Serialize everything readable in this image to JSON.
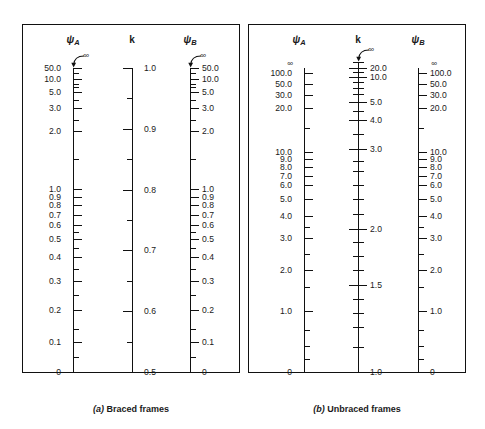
{
  "figure": {
    "panels": [
      {
        "id": "braced",
        "caption_letter": "(a)",
        "caption_text": "Braced frames",
        "headers": {
          "psi_a": "ψ",
          "psi_a_sub": "A",
          "k": "k",
          "psi_b": "ψ",
          "psi_b_sub": "B"
        },
        "infinity_symbol": "∞"
      },
      {
        "id": "unbraced",
        "caption_letter": "(b)",
        "caption_text": "Unbraced frames",
        "headers": {
          "psi_a": "ψ",
          "psi_a_sub": "A",
          "k": "k",
          "psi_b": "ψ",
          "psi_b_sub": "B"
        },
        "infinity_symbol": "∞"
      }
    ]
  },
  "chart_data": [
    {
      "type": "line",
      "title": "(a) Braced frames",
      "subtitle": "Alignment chart (nomograph) for effective length factor K",
      "grid": false,
      "legend": "none",
      "xlabel": "",
      "ylabel": "",
      "scales": [
        {
          "name": "psi_A",
          "label": "ψA",
          "position": "left",
          "tick_side": "right",
          "label_side": "left",
          "top_value": "∞",
          "has_infinity_arrow": true,
          "bottom_value": "0",
          "ticks": [
            {
              "label": "50.0",
              "major": true,
              "y": 0.0
            },
            {
              "label": "",
              "major": false,
              "y": 0.018
            },
            {
              "label": "10.0",
              "major": true,
              "y": 0.036
            },
            {
              "label": "",
              "major": false,
              "y": 0.052
            },
            {
              "label": "",
              "major": false,
              "y": 0.064
            },
            {
              "label": "5.0",
              "major": true,
              "y": 0.078
            },
            {
              "label": "",
              "major": false,
              "y": 0.104
            },
            {
              "label": "3.0",
              "major": true,
              "y": 0.13
            },
            {
              "label": "",
              "major": false,
              "y": 0.17
            },
            {
              "label": "2.0",
              "major": true,
              "y": 0.208
            },
            {
              "label": "",
              "major": false,
              "y": 0.3
            },
            {
              "label": "1.0",
              "major": true,
              "y": 0.398
            },
            {
              "label": "0.9",
              "major": true,
              "y": 0.424
            },
            {
              "label": "0.8",
              "major": true,
              "y": 0.452
            },
            {
              "label": "0.7",
              "major": true,
              "y": 0.483
            },
            {
              "label": "0.6",
              "major": true,
              "y": 0.518
            },
            {
              "label": "",
              "major": false,
              "y": 0.54
            },
            {
              "label": "0.5",
              "major": true,
              "y": 0.562
            },
            {
              "label": "",
              "major": false,
              "y": 0.592
            },
            {
              "label": "0.4",
              "major": true,
              "y": 0.622
            },
            {
              "label": "",
              "major": false,
              "y": 0.66
            },
            {
              "label": "0.3",
              "major": true,
              "y": 0.7
            },
            {
              "label": "",
              "major": false,
              "y": 0.748
            },
            {
              "label": "0.2",
              "major": true,
              "y": 0.796
            },
            {
              "label": "",
              "major": false,
              "y": 0.858
            },
            {
              "label": "0.1",
              "major": true,
              "y": 0.9
            },
            {
              "label": "",
              "major": false,
              "y": 0.952
            },
            {
              "label": "0",
              "major": true,
              "y": 1.0
            }
          ]
        },
        {
          "name": "k",
          "label": "k",
          "position": "center",
          "tick_side": "left",
          "label_side": "right",
          "top_value": "1.0",
          "has_infinity_arrow": false,
          "bottom_value": "0.5",
          "ticks": [
            {
              "label": "1.0",
              "major": true,
              "y": 0.0
            },
            {
              "label": "",
              "major": false,
              "y": 0.1
            },
            {
              "label": "0.9",
              "major": true,
              "y": 0.2
            },
            {
              "label": "",
              "major": false,
              "y": 0.3
            },
            {
              "label": "0.8",
              "major": true,
              "y": 0.4
            },
            {
              "label": "",
              "major": false,
              "y": 0.5
            },
            {
              "label": "0.7",
              "major": true,
              "y": 0.6
            },
            {
              "label": "",
              "major": false,
              "y": 0.7
            },
            {
              "label": "0.6",
              "major": true,
              "y": 0.8
            },
            {
              "label": "",
              "major": false,
              "y": 0.9
            },
            {
              "label": "0.5",
              "major": true,
              "y": 1.0
            }
          ]
        },
        {
          "name": "psi_B",
          "label": "ψB",
          "position": "right",
          "tick_side": "right",
          "label_side": "right",
          "top_value": "∞",
          "has_infinity_arrow": true,
          "bottom_value": "0",
          "ticks": [
            {
              "label": "50.0",
              "major": true,
              "y": 0.0
            },
            {
              "label": "",
              "major": false,
              "y": 0.018
            },
            {
              "label": "10.0",
              "major": true,
              "y": 0.036
            },
            {
              "label": "",
              "major": false,
              "y": 0.052
            },
            {
              "label": "",
              "major": false,
              "y": 0.064
            },
            {
              "label": "5.0",
              "major": true,
              "y": 0.078
            },
            {
              "label": "",
              "major": false,
              "y": 0.104
            },
            {
              "label": "3.0",
              "major": true,
              "y": 0.13
            },
            {
              "label": "",
              "major": false,
              "y": 0.17
            },
            {
              "label": "2.0",
              "major": true,
              "y": 0.208
            },
            {
              "label": "",
              "major": false,
              "y": 0.3
            },
            {
              "label": "1.0",
              "major": true,
              "y": 0.398
            },
            {
              "label": "0.9",
              "major": true,
              "y": 0.424
            },
            {
              "label": "0.8",
              "major": true,
              "y": 0.452
            },
            {
              "label": "0.7",
              "major": true,
              "y": 0.483
            },
            {
              "label": "0.6",
              "major": true,
              "y": 0.518
            },
            {
              "label": "",
              "major": false,
              "y": 0.54
            },
            {
              "label": "0.5",
              "major": true,
              "y": 0.562
            },
            {
              "label": "",
              "major": false,
              "y": 0.592
            },
            {
              "label": "0.4",
              "major": true,
              "y": 0.622
            },
            {
              "label": "",
              "major": false,
              "y": 0.66
            },
            {
              "label": "0.3",
              "major": true,
              "y": 0.7
            },
            {
              "label": "",
              "major": false,
              "y": 0.748
            },
            {
              "label": "0.2",
              "major": true,
              "y": 0.796
            },
            {
              "label": "",
              "major": false,
              "y": 0.858
            },
            {
              "label": "0.1",
              "major": true,
              "y": 0.9
            },
            {
              "label": "",
              "major": false,
              "y": 0.952
            },
            {
              "label": "0",
              "major": true,
              "y": 1.0
            }
          ]
        }
      ]
    },
    {
      "type": "line",
      "title": "(b) Unbraced frames",
      "subtitle": "Alignment chart (nomograph) for effective length factor K",
      "grid": false,
      "legend": "none",
      "xlabel": "",
      "ylabel": "",
      "scales": [
        {
          "name": "psi_A",
          "label": "ψA",
          "position": "left",
          "tick_side": "right",
          "label_side": "left",
          "top_value": "∞",
          "has_infinity_arrow": false,
          "bottom_value": "0",
          "ticks": [
            {
              "label": "100.0",
              "major": true,
              "y": 0.018
            },
            {
              "label": "50.0",
              "major": true,
              "y": 0.052
            },
            {
              "label": "30.0",
              "major": true,
              "y": 0.09
            },
            {
              "label": "20.0",
              "major": true,
              "y": 0.132
            },
            {
              "label": "",
              "major": false,
              "y": 0.196
            },
            {
              "label": "10.0",
              "major": true,
              "y": 0.276
            },
            {
              "label": "9.0",
              "major": true,
              "y": 0.3
            },
            {
              "label": "8.0",
              "major": true,
              "y": 0.326
            },
            {
              "label": "7.0",
              "major": true,
              "y": 0.354
            },
            {
              "label": "6.0",
              "major": true,
              "y": 0.386
            },
            {
              "label": "5.0",
              "major": true,
              "y": 0.43
            },
            {
              "label": "4.0",
              "major": true,
              "y": 0.486
            },
            {
              "label": "",
              "major": false,
              "y": 0.524
            },
            {
              "label": "3.0",
              "major": true,
              "y": 0.56
            },
            {
              "label": "",
              "major": false,
              "y": 0.612
            },
            {
              "label": "2.0",
              "major": true,
              "y": 0.666
            },
            {
              "label": "",
              "major": false,
              "y": 0.72
            },
            {
              "label": "1.0",
              "major": true,
              "y": 0.8
            },
            {
              "label": "",
              "major": false,
              "y": 0.862
            },
            {
              "label": "",
              "major": false,
              "y": 0.916
            },
            {
              "label": "",
              "major": false,
              "y": 0.958
            },
            {
              "label": "0",
              "major": true,
              "y": 1.0
            }
          ]
        },
        {
          "name": "k",
          "label": "k",
          "position": "center",
          "tick_side": "both",
          "label_side": "right",
          "top_value": "∞",
          "has_infinity_arrow": true,
          "bottom_value": "1.0",
          "ticks": [
            {
              "label": "",
              "major": false,
              "y": 0.0
            },
            {
              "label": "20.0",
              "major": true,
              "y": 0.018
            },
            {
              "label": "",
              "major": false,
              "y": 0.032
            },
            {
              "label": "10.0",
              "major": true,
              "y": 0.048
            },
            {
              "label": "",
              "major": false,
              "y": 0.066
            },
            {
              "label": "",
              "major": false,
              "y": 0.084
            },
            {
              "label": "",
              "major": false,
              "y": 0.104
            },
            {
              "label": "5.0",
              "major": true,
              "y": 0.13
            },
            {
              "label": "",
              "major": false,
              "y": 0.158
            },
            {
              "label": "4.0",
              "major": true,
              "y": 0.188
            },
            {
              "label": "",
              "major": false,
              "y": 0.232
            },
            {
              "label": "3.0",
              "major": true,
              "y": 0.282
            },
            {
              "label": "",
              "major": false,
              "y": 0.318
            },
            {
              "label": "",
              "major": false,
              "y": 0.352
            },
            {
              "label": "",
              "major": false,
              "y": 0.396
            },
            {
              "label": "",
              "major": false,
              "y": 0.442
            },
            {
              "label": "",
              "major": false,
              "y": 0.49
            },
            {
              "label": "2.0",
              "major": true,
              "y": 0.54
            },
            {
              "label": "",
              "major": false,
              "y": 0.58
            },
            {
              "label": "",
              "major": false,
              "y": 0.626
            },
            {
              "label": "",
              "major": false,
              "y": 0.672
            },
            {
              "label": "1.5",
              "major": true,
              "y": 0.718
            },
            {
              "label": "",
              "major": false,
              "y": 0.764
            },
            {
              "label": "",
              "major": false,
              "y": 0.81
            },
            {
              "label": "",
              "major": false,
              "y": 0.856
            },
            {
              "label": "",
              "major": false,
              "y": 0.92
            },
            {
              "label": "1.0",
              "major": true,
              "y": 1.0
            }
          ]
        },
        {
          "name": "psi_B",
          "label": "ψB",
          "position": "right",
          "tick_side": "right",
          "label_side": "right",
          "top_value": "∞",
          "has_infinity_arrow": false,
          "bottom_value": "0",
          "ticks": [
            {
              "label": "100.0",
              "major": true,
              "y": 0.018
            },
            {
              "label": "50.0",
              "major": true,
              "y": 0.052
            },
            {
              "label": "30.0",
              "major": true,
              "y": 0.09
            },
            {
              "label": "20.0",
              "major": true,
              "y": 0.132
            },
            {
              "label": "",
              "major": false,
              "y": 0.196
            },
            {
              "label": "10.0",
              "major": true,
              "y": 0.276
            },
            {
              "label": "9.0",
              "major": true,
              "y": 0.3
            },
            {
              "label": "8.0",
              "major": true,
              "y": 0.326
            },
            {
              "label": "7.0",
              "major": true,
              "y": 0.354
            },
            {
              "label": "6.0",
              "major": true,
              "y": 0.386
            },
            {
              "label": "5.0",
              "major": true,
              "y": 0.43
            },
            {
              "label": "4.0",
              "major": true,
              "y": 0.486
            },
            {
              "label": "",
              "major": false,
              "y": 0.524
            },
            {
              "label": "3.0",
              "major": true,
              "y": 0.56
            },
            {
              "label": "",
              "major": false,
              "y": 0.612
            },
            {
              "label": "2.0",
              "major": true,
              "y": 0.666
            },
            {
              "label": "",
              "major": false,
              "y": 0.72
            },
            {
              "label": "1.0",
              "major": true,
              "y": 0.8
            },
            {
              "label": "",
              "major": false,
              "y": 0.862
            },
            {
              "label": "",
              "major": false,
              "y": 0.916
            },
            {
              "label": "",
              "major": false,
              "y": 0.958
            },
            {
              "label": "0",
              "major": true,
              "y": 1.0
            }
          ]
        }
      ]
    }
  ]
}
